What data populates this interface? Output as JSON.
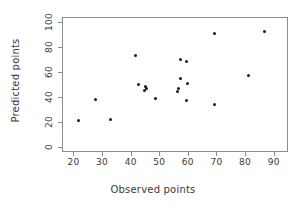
{
  "chart_data": {
    "type": "scatter",
    "title": "",
    "xlabel": "Observed points",
    "ylabel": "Predicted points",
    "xlim": [
      16,
      95
    ],
    "ylim": [
      -4,
      104
    ],
    "xticks": [
      20,
      30,
      40,
      50,
      60,
      70,
      80,
      90
    ],
    "yticks": [
      0,
      20,
      40,
      60,
      80,
      100
    ],
    "grid": false,
    "legend": null,
    "marker": "filled-circle",
    "marker_color": "#1a1a1a",
    "points": [
      {
        "x": 21.5,
        "y": 22
      },
      {
        "x": 27.5,
        "y": 39
      },
      {
        "x": 32.5,
        "y": 23
      },
      {
        "x": 41.5,
        "y": 74
      },
      {
        "x": 42.5,
        "y": 51
      },
      {
        "x": 44.5,
        "y": 46
      },
      {
        "x": 45.0,
        "y": 49
      },
      {
        "x": 45.3,
        "y": 48
      },
      {
        "x": 48.5,
        "y": 40
      },
      {
        "x": 56.0,
        "y": 45
      },
      {
        "x": 56.3,
        "y": 48
      },
      {
        "x": 57.0,
        "y": 71
      },
      {
        "x": 57.2,
        "y": 56
      },
      {
        "x": 59.0,
        "y": 69
      },
      {
        "x": 59.5,
        "y": 52
      },
      {
        "x": 59.3,
        "y": 38
      },
      {
        "x": 68.8,
        "y": 92
      },
      {
        "x": 69.0,
        "y": 35
      },
      {
        "x": 81.0,
        "y": 58
      },
      {
        "x": 86.5,
        "y": 93
      }
    ]
  },
  "axes": {
    "x_tick_labels": [
      "20",
      "30",
      "40",
      "50",
      "60",
      "70",
      "80",
      "90"
    ],
    "y_tick_labels": [
      "0",
      "20",
      "40",
      "60",
      "80",
      "100"
    ]
  }
}
